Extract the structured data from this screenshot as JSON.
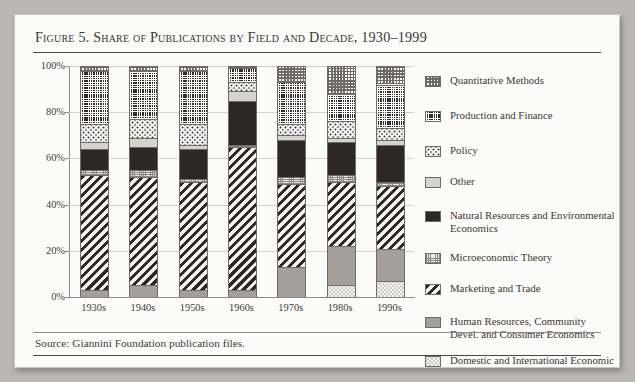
{
  "figure": {
    "title": "Figure 5. Share of Publications by Field and Decade, 1930–1999",
    "source": "Source: Giannini Foundation publication files."
  },
  "chart_data": {
    "type": "bar",
    "stacked": true,
    "stack_mode": "percent",
    "title": "Figure 5. Share of Publications by Field and Decade, 1930–1999",
    "xlabel": "",
    "ylabel": "",
    "ylim": [
      0,
      100
    ],
    "yticks": [
      "0%",
      "20%",
      "40%",
      "60%",
      "80%",
      "100%"
    ],
    "ytick_values": [
      0,
      20,
      40,
      60,
      80,
      100
    ],
    "grid": true,
    "legend_position": "right",
    "categories": [
      "1930s",
      "1940s",
      "1950s",
      "1960s",
      "1970s",
      "1980s",
      "1990s"
    ],
    "series": [
      {
        "name": "Domestic and International Economic Development",
        "pattern": "p-domestic",
        "values": [
          0,
          0,
          0,
          0,
          0,
          5,
          7
        ]
      },
      {
        "name": "Human Resources, Community Devel. and Consumer Economics",
        "pattern": "p-human",
        "values": [
          3,
          5,
          3,
          3,
          13,
          17,
          14
        ]
      },
      {
        "name": "Marketing and Trade",
        "pattern": "p-market",
        "values": [
          50,
          47,
          47,
          62,
          36,
          28,
          27
        ]
      },
      {
        "name": "Microeconomic Theory",
        "pattern": "p-micro",
        "values": [
          2,
          3,
          1,
          1,
          3,
          3,
          2
        ]
      },
      {
        "name": "Natural Resources and Environmental Economics",
        "pattern": "p-natres",
        "values": [
          9,
          10,
          13,
          19,
          16,
          14,
          16
        ]
      },
      {
        "name": "Other",
        "pattern": "p-other",
        "values": [
          3,
          4,
          2,
          4,
          2,
          2,
          2
        ]
      },
      {
        "name": "Policy",
        "pattern": "p-policy",
        "values": [
          8,
          8,
          9,
          4,
          5,
          7,
          5
        ]
      },
      {
        "name": "Production and Finance",
        "pattern": "p-prod",
        "values": [
          23,
          21,
          23,
          6,
          18,
          12,
          19
        ]
      },
      {
        "name": "Quantitative Methods",
        "pattern": "p-quant",
        "values": [
          2,
          2,
          2,
          1,
          7,
          12,
          8
        ]
      }
    ]
  },
  "legend": {
    "items": [
      {
        "label": "Quantitative Methods",
        "pattern": "p-quant"
      },
      {
        "label": "Production and Finance",
        "pattern": "p-prod"
      },
      {
        "label": "Policy",
        "pattern": "p-policy"
      },
      {
        "label": "Other",
        "pattern": "p-other"
      },
      {
        "label": "Natural Resources and Environmental Economics",
        "pattern": "p-natres"
      },
      {
        "label": "Microeconomic Theory",
        "pattern": "p-micro"
      },
      {
        "label": "Marketing and Trade",
        "pattern": "p-market"
      },
      {
        "label": "Human Resources, Community Devel. and Consumer Economics",
        "pattern": "p-human"
      },
      {
        "label": "Domestic and International Economic Development",
        "pattern": "p-domestic"
      }
    ]
  }
}
